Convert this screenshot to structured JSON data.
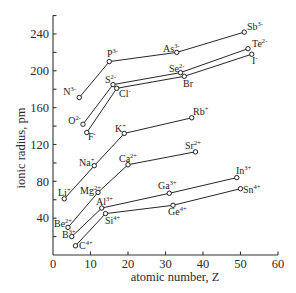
{
  "chart_data": {
    "type": "line",
    "title": "",
    "xlabel": "atomic number, Z",
    "ylabel": "ionic radius, pm",
    "xlim": [
      0,
      60
    ],
    "ylim": [
      0,
      260
    ],
    "x_ticks": [
      0,
      10,
      20,
      30,
      40,
      50,
      60
    ],
    "y_ticks_labeled": [
      40,
      80,
      120,
      160,
      200,
      240
    ],
    "y_ticks_minor_step": 20,
    "grid": false,
    "legend": "none (points labeled directly)",
    "series": [
      {
        "name": "Group 15 anions (3-)",
        "points": [
          {
            "ion": "N",
            "charge": "3-",
            "z": 7,
            "r": 171,
            "lx": 76,
            "ly": 95,
            "anchor": "end"
          },
          {
            "ion": "P",
            "charge": "3-",
            "z": 15,
            "r": 210,
            "lx": 107,
            "ly": 57,
            "anchor": "start"
          },
          {
            "ion": "As",
            "charge": "3-",
            "z": 33,
            "r": 220,
            "lx": 163,
            "ly": 52,
            "anchor": "start"
          },
          {
            "ion": "Sb",
            "charge": "3-",
            "z": 51,
            "r": 242,
            "lx": 247,
            "ly": 30,
            "anchor": "start"
          }
        ]
      },
      {
        "name": "Group 16 anions (2-)",
        "points": [
          {
            "ion": "O",
            "charge": "2-",
            "z": 8,
            "r": 142,
            "lx": 81,
            "ly": 124,
            "anchor": "end"
          },
          {
            "ion": "S",
            "charge": "2-",
            "z": 16,
            "r": 185,
            "lx": 105,
            "ly": 83,
            "anchor": "start"
          },
          {
            "ion": "Se",
            "charge": "2-",
            "z": 34,
            "r": 198,
            "lx": 169,
            "ly": 72,
            "anchor": "start"
          },
          {
            "ion": "Te",
            "charge": "2-",
            "z": 52,
            "r": 224,
            "lx": 252,
            "ly": 47,
            "anchor": "start"
          }
        ]
      },
      {
        "name": "Group 17 anions (-)",
        "points": [
          {
            "ion": "F",
            "charge": "-",
            "z": 9,
            "r": 133,
            "lx": 88,
            "ly": 140,
            "anchor": "start"
          },
          {
            "ion": "Cl",
            "charge": "-",
            "z": 17,
            "r": 181,
            "lx": 119,
            "ly": 97,
            "anchor": "start"
          },
          {
            "ion": "Br",
            "charge": "",
            "z": 35,
            "r": 194,
            "lx": 183,
            "ly": 87,
            "anchor": "start"
          },
          {
            "ion": "I",
            "charge": "-",
            "z": 53,
            "r": 218,
            "lx": 252,
            "ly": 64,
            "anchor": "start"
          }
        ]
      },
      {
        "name": "Group 1 cations (+)",
        "points": [
          {
            "ion": "Li",
            "charge": "+",
            "z": 3,
            "r": 61,
            "lx": 58,
            "ly": 196,
            "anchor": "start"
          },
          {
            "ion": "Na",
            "charge": "+",
            "z": 11,
            "r": 97,
            "lx": 79,
            "ly": 166,
            "anchor": "start"
          },
          {
            "ion": "K",
            "charge": "+",
            "z": 19,
            "r": 132,
            "lx": 115,
            "ly": 132,
            "anchor": "start"
          },
          {
            "ion": "Rb",
            "charge": "+",
            "z": 37,
            "r": 149,
            "lx": 193,
            "ly": 115,
            "anchor": "start"
          }
        ]
      },
      {
        "name": "Group 2 cations (2+)",
        "points": [
          {
            "ion": "Be",
            "charge": "2+",
            "z": 4,
            "r": 30,
            "lx": 54,
            "ly": 227,
            "anchor": "start"
          },
          {
            "ion": "Mg",
            "charge": "2+",
            "z": 12,
            "r": 68,
            "lx": 80,
            "ly": 194,
            "anchor": "start"
          },
          {
            "ion": "Ca",
            "charge": "2+",
            "z": 20,
            "r": 98,
            "lx": 119,
            "ly": 162,
            "anchor": "start"
          },
          {
            "ion": "Sr",
            "charge": "2+",
            "z": 38,
            "r": 112,
            "lx": 185,
            "ly": 149,
            "anchor": "start"
          }
        ]
      },
      {
        "name": "Group 13 cations (3+)",
        "points": [
          {
            "ion": "B",
            "charge": "3+",
            "z": 5,
            "r": 20,
            "lx": 62,
            "ly": 238,
            "anchor": "start"
          },
          {
            "ion": "Al",
            "charge": "3+",
            "z": 13,
            "r": 51,
            "lx": 96,
            "ly": 205,
            "anchor": "start"
          },
          {
            "ion": "Ga",
            "charge": "3+",
            "z": 31,
            "r": 67,
            "lx": 158,
            "ly": 189,
            "anchor": "start"
          },
          {
            "ion": "In",
            "charge": "3+",
            "z": 49,
            "r": 84,
            "lx": 236,
            "ly": 174,
            "anchor": "start"
          }
        ]
      },
      {
        "name": "Group 14 cations (4+)",
        "points": [
          {
            "ion": "C",
            "charge": "4+",
            "z": 6,
            "r": 10,
            "lx": 79,
            "ly": 249,
            "anchor": "start"
          },
          {
            "ion": "Si",
            "charge": "4+",
            "z": 14,
            "r": 45,
            "lx": 105,
            "ly": 224,
            "anchor": "start"
          },
          {
            "ion": "Ge",
            "charge": "4+",
            "z": 32,
            "r": 54,
            "lx": 168,
            "ly": 215,
            "anchor": "start"
          },
          {
            "ion": "Sn",
            "charge": "4+",
            "z": 50,
            "r": 72,
            "lx": 243,
            "ly": 193,
            "anchor": "start"
          }
        ]
      }
    ]
  },
  "layout": {
    "plot_origin_px": [
      53,
      255
    ],
    "px_per_z": 3.75,
    "px_per_pm": 0.921,
    "colors": {
      "line": "#262626",
      "axis": "#333333",
      "text": "#2a2a2a",
      "background": "#ffffff"
    }
  }
}
